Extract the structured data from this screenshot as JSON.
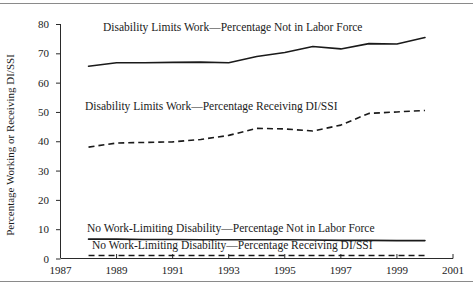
{
  "chart_data": {
    "type": "line",
    "title": "",
    "xlabel": "",
    "ylabel": "Percentage Working or Receiving DI/SSI",
    "xlim": [
      1987,
      2001
    ],
    "ylim": [
      0,
      80
    ],
    "grid": false,
    "legend_position": "inline-annotations",
    "x_ticks": [
      1987,
      1989,
      1991,
      1993,
      1995,
      1997,
      1999,
      2001
    ],
    "x_tick_labels": [
      "1987",
      "1989",
      "1991",
      "1993",
      "1995",
      "1997",
      "1999",
      "2001"
    ],
    "y_ticks": [
      0,
      10,
      20,
      30,
      40,
      50,
      60,
      70,
      80
    ],
    "y_tick_labels": [
      "0",
      "10",
      "20",
      "30",
      "40",
      "50",
      "60",
      "70",
      "80"
    ],
    "x": [
      1988,
      1989,
      1990,
      1991,
      1992,
      1993,
      1994,
      1995,
      1996,
      1997,
      1998,
      1999,
      2000
    ],
    "series": [
      {
        "name": "Disability Limits Work—Percentage Not in Labor Force",
        "style": "solid",
        "color": "#1a1a1a",
        "values": [
          65.6,
          66.8,
          66.8,
          66.9,
          67.0,
          66.8,
          68.9,
          70.3,
          72.3,
          71.5,
          73.3,
          73.2,
          75.4
        ]
      },
      {
        "name": "Disability Limits Work—Percentage Receiving DI/SSI",
        "style": "dashed",
        "color": "#1a1a1a",
        "values": [
          38.0,
          39.4,
          39.6,
          39.8,
          40.6,
          42.0,
          44.4,
          44.2,
          43.5,
          45.5,
          49.5,
          50.0,
          50.5
        ]
      },
      {
        "name": "No Work-Limiting Disability—Percentage Not in Labor Force",
        "style": "solid",
        "color": "#1a1a1a",
        "values": [
          6.6,
          6.6,
          6.5,
          6.5,
          6.4,
          6.4,
          6.4,
          6.4,
          6.3,
          6.2,
          6.2,
          6.1,
          6.1
        ]
      },
      {
        "name": "No Work-Limiting Disability—Percentage Receiving DI/SSI",
        "style": "dashed",
        "color": "#1a1a1a",
        "values": [
          1.0,
          1.0,
          1.0,
          1.0,
          1.0,
          1.0,
          1.0,
          1.0,
          1.0,
          1.0,
          1.0,
          1.0,
          1.0
        ]
      }
    ],
    "annotations": [
      {
        "text": "Disability Limits Work—Percentage Not in Labor Force",
        "x_px": 103,
        "y_px": 31
      },
      {
        "text": "Disability Limits Work—Percentage Receiving DI/SSI",
        "x_px": 85,
        "y_px": 110
      },
      {
        "text": "No Work-Limiting Disability—Percentage Not in Labor Force",
        "x_px": 87,
        "y_px": 232
      },
      {
        "text": "No Work-Limiting Disability—Percentage Receiving DI/SSI",
        "x_px": 92,
        "y_px": 249
      }
    ]
  }
}
